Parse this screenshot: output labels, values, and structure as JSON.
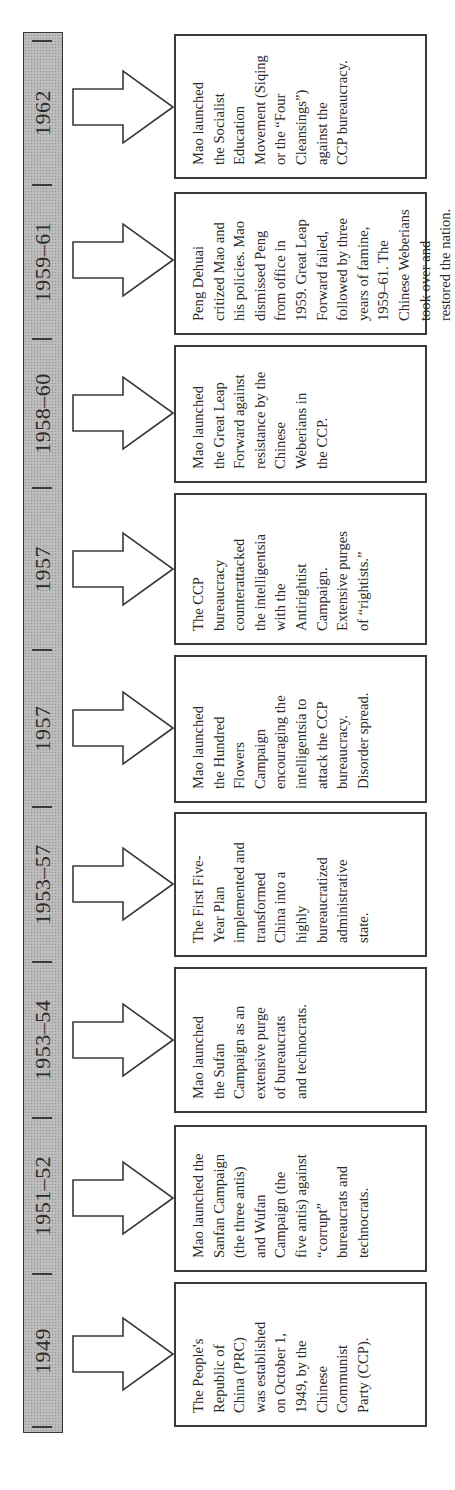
{
  "diagram": {
    "type": "timeline",
    "orientation": "rotated-90-ccw",
    "colors": {
      "bar_fill": "#b8b8b8",
      "border": "#3a3a3a",
      "text": "#2a2a2a",
      "box_fill": "#ffffff"
    }
  },
  "events": [
    {
      "period": "1949",
      "text": "The People's\nRepublic of\nChina (PRC)\nwas established\non October 1,\n1949, by the\nChinese\nCommunist\nParty (CCP)."
    },
    {
      "period": "1951–52",
      "text": "Mao launched the\nSanfan Campaign\n(the three antis)\nand Wufan\nCampaign (the\nfive antis) against\n“corrupt”\nbureaucrats and\ntechnocrats."
    },
    {
      "period": "1953–54",
      "text": "Mao launched\nthe Sufan\nCampaign as an\nextensive purge\nof bureaucrats\nand technocrats."
    },
    {
      "period": "1953–57",
      "text": "The First Five-\nYear Plan\nimplemented and\ntransformed\nChina into a\nhighly\nbureaucratized\nadministrative\nstate."
    },
    {
      "period": "1957",
      "text": "Mao launched\nthe Hundred\nFlowers\nCampaign\nencouraging the\nintelligentsia to\nattack the CCP\nbureaucracy.\nDisorder spread."
    },
    {
      "period": "1957",
      "text": "The CCP\nbureaucracy\ncounterattacked\nthe intelligentsia\nwith the\nAntirightist\nCampaign.\nExtensive purges\nof “rightists.”"
    },
    {
      "period": "1958–60",
      "text": "Mao launched\nthe Great Leap\nForward against\nresistance by the\nChinese\nWeberians in\nthe CCP."
    },
    {
      "period": "1959–61",
      "text": "Peng Dehuai\ncritized Mao and\nhis policies. Mao\ndismissed Peng\nfrom office in\n1959. Great Leap\nForward failed,\nfollowed by three\nyears of famine,\n1959–61. The\nChinese Weberians\ntook over and\nrestored the nation."
    },
    {
      "period": "1962",
      "text": "Mao launched\nthe Socialist\nEducation\nMovement (Siqing\nor the “Four\nCleansings”)\nagainst the\nCCP bureaucracy."
    }
  ]
}
